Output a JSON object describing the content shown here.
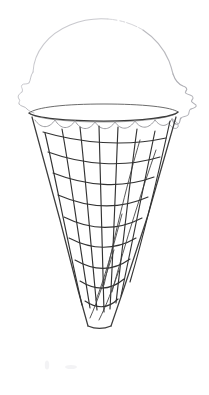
{
  "artwork": {
    "title": "Ice Cream Cone Line Drawing",
    "subject": "ice-cream-cone",
    "medium": "pencil line sketch",
    "background_color": "#ffffff",
    "canvas": {
      "width": 209,
      "height": 395
    }
  },
  "palette": {
    "background": "#ffffff",
    "scoop_outline": "#b9b9be",
    "scoop_outline_faint": "#d2d2d6",
    "cone_rim": "#3a3a3a",
    "cone_edge": "#3d3d3d",
    "waffle_line": "#333333",
    "drip_line": "#9a9a9e",
    "smudge": "#f2f2f4"
  },
  "parts": {
    "scoop": {
      "label": "Ice cream scoop",
      "description": "Light gray scalloped lumpy outline sitting on the cone rim",
      "bounds": {
        "x": 17,
        "y": 18,
        "width": 180,
        "height": 100
      },
      "peak_y": 20,
      "left_extent_x": 17,
      "right_extent_x": 197,
      "outline_path": "M 31 70 C 31 46 52 24 86 20 C 110 17 131 21 147 32 C 160 41 168 53 172 66 C 176 78 180 86 186 88 C 191 90 194 93 192 96 C 189 99 193 101 196 104 C 197 107 192 108 189 111 C 186 114 190 116 186 119 C 182 121 177 118 174 115 L 170 112 L 36 112 C 33 110 29 108 26 105 C 22 102 26 99 23 96 C 20 93 24 90 21 87 C 18 84 23 81 22 78 C 21 75 25 73 31 70 Z",
      "bumps_left": 5,
      "bumps_right": 7
    },
    "cone_rim": {
      "label": "Cone rim ellipse",
      "center_x": 103,
      "center_y": 113,
      "radius_x": 75,
      "radius_y": 7,
      "left_x": 28,
      "right_x": 178
    },
    "drip": {
      "label": "Melting drip scallop line",
      "description": "Wavy scalloped line just below the cone rim where ice cream melts over the edge",
      "path": "M 34 119 C 40 128 48 128 54 120 C 60 129 68 129 74 121 C 80 130 88 130 94 122 C 100 130 108 130 114 122 C 120 130 128 129 134 121 C 140 129 148 128 154 120 C 160 127 166 126 172 118",
      "scallop_count": 7
    },
    "cone_body": {
      "label": "Waffle cone",
      "description": "Tapering cone from rim down to a flat truncated tip, filled with a crosshatch waffle texture",
      "top_left_x": 32,
      "top_right_x": 176,
      "top_y": 117,
      "tip_left_x": 88,
      "tip_right_x": 111,
      "tip_y": 326,
      "height": 209
    },
    "waffle": {
      "label": "Waffle crosshatch texture",
      "description": "Converging near-vertical lines crossed by downward-arcing horizontal bands",
      "vertical_line_count": 8,
      "horizontal_band_count": 9,
      "style": "hand-drawn wobbly grid"
    },
    "smudges": {
      "label": "Faint graphite smudges",
      "description": "Two very light pencil smudges on the blank paper below the cone",
      "marks": [
        {
          "x": 45,
          "y": 361,
          "width": 4,
          "height": 9
        },
        {
          "x": 65,
          "y": 365,
          "width": 12,
          "height": 4
        }
      ]
    }
  }
}
